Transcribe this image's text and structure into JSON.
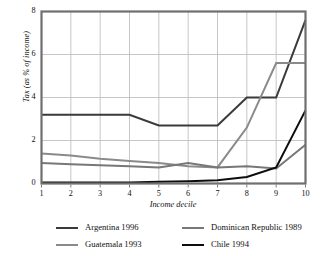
{
  "chart_data": {
    "type": "line",
    "title": "",
    "xlabel": "Income decile",
    "ylabel": "Tax (as % of income)",
    "categories": [
      "1",
      "2",
      "3",
      "4",
      "5",
      "6",
      "7",
      "8",
      "9",
      "10"
    ],
    "x": [
      1,
      2,
      3,
      4,
      5,
      6,
      7,
      8,
      9,
      10
    ],
    "xlim": [
      1,
      10
    ],
    "ylim": [
      0,
      8
    ],
    "yticks": [
      0,
      2,
      4,
      6,
      8
    ],
    "xticks": [
      1,
      2,
      3,
      4,
      5,
      6,
      7,
      8,
      9,
      10
    ],
    "grid": true,
    "legend_position": "below",
    "series": [
      {
        "name": "Argentina 1996",
        "color": "#3a3a3a",
        "width": 2.0,
        "values": [
          3.2,
          3.2,
          3.2,
          3.2,
          2.7,
          2.7,
          2.7,
          4.0,
          4.0,
          7.6
        ]
      },
      {
        "name": "Guatemala 1993",
        "color": "#8a8a8a",
        "width": 2.0,
        "values": [
          1.4,
          1.3,
          1.15,
          1.05,
          0.95,
          0.8,
          0.75,
          2.6,
          5.6,
          5.6
        ]
      },
      {
        "name": "Dominican Republic 1989",
        "color": "#777777",
        "width": 2.0,
        "values": [
          0.95,
          0.9,
          0.85,
          0.8,
          0.75,
          0.95,
          0.75,
          0.8,
          0.7,
          1.8
        ]
      },
      {
        "name": "Chile 1994",
        "color": "#0d0d0d",
        "width": 2.0,
        "values": [
          0.05,
          0.05,
          0.05,
          0.05,
          0.08,
          0.1,
          0.15,
          0.3,
          0.75,
          3.4
        ]
      }
    ]
  },
  "legend": {
    "columns": [
      [
        "Argentina 1996",
        "Guatemala 1993"
      ],
      [
        "Dominican Republic 1989",
        "Chile 1994"
      ]
    ]
  },
  "axes": {
    "y_tick_labels": [
      "8",
      "6",
      "4",
      "2",
      "0"
    ],
    "x_tick_labels": [
      "1",
      "2",
      "3",
      "4",
      "5",
      "6",
      "7",
      "8",
      "9",
      "10"
    ]
  },
  "colors": {
    "frame": "#6f6f6f",
    "grid": "#b9b9b9",
    "argentina": "#3a3a3a",
    "guatemala": "#8a8a8a",
    "dominican_republic": "#777777",
    "chile": "#0d0d0d"
  }
}
